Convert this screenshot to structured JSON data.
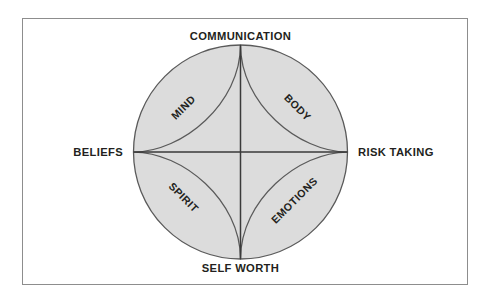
{
  "diagram": {
    "type": "circle-quadrant-astroid",
    "colors": {
      "circle_fill": "#dcdcdc",
      "circle_stroke": "#5a5a5a",
      "axis_stroke": "#3a3a3a",
      "curve_stroke": "#5a5a5a",
      "frame_stroke": "#8d8d8d",
      "text": "#231f20",
      "background": "#ffffff"
    },
    "geometry": {
      "center_x": 240.5,
      "center_y": 152,
      "radius": 107
    },
    "axis_labels": [
      {
        "id": "top",
        "text": "COMMUNICATION",
        "x": 240.5,
        "y": 40,
        "anchor": "middle"
      },
      {
        "id": "right",
        "text": "RISK TAKING",
        "x": 358,
        "y": 156,
        "anchor": "start"
      },
      {
        "id": "bottom",
        "text": "SELF WORTH",
        "x": 240.5,
        "y": 272,
        "anchor": "middle"
      },
      {
        "id": "left",
        "text": "BELIEFS",
        "x": 123,
        "y": 156,
        "anchor": "end"
      }
    ],
    "quadrant_labels": [
      {
        "id": "mind",
        "text": "MIND",
        "x": 186,
        "y": 110,
        "rotate": -45
      },
      {
        "id": "body",
        "text": "BODY",
        "x": 295,
        "y": 110,
        "rotate": 45
      },
      {
        "id": "spirit",
        "text": "SPIRIT",
        "x": 181,
        "y": 200,
        "rotate": 45
      },
      {
        "id": "emotions",
        "text": "EMOTIONS",
        "x": 297,
        "y": 203,
        "rotate": -45
      }
    ]
  }
}
